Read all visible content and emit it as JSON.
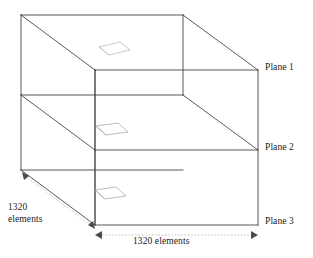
{
  "diagram": {
    "type": "3d-box-mesh-schematic",
    "title": "",
    "box": {
      "description": "Rectangular prism divided into three horizontal planes",
      "line_color": "#3a3a3a",
      "element_marker_color": "#b9b9b9",
      "dimension_line_color": "#9a9a9a"
    },
    "plane_labels": [
      {
        "id": "plane-1",
        "text": "Plane 1"
      },
      {
        "id": "plane-2",
        "text": "Plane 2"
      },
      {
        "id": "plane-3",
        "text": "Plane 3"
      }
    ],
    "dimensions": [
      {
        "id": "depth-dimension",
        "line1": "1320",
        "line2": "elements",
        "full_text": "1320 elements",
        "orientation": "depth-receding"
      },
      {
        "id": "width-dimension",
        "full_text": "1320 elements",
        "orientation": "horizontal-front-bottom"
      }
    ],
    "element_markers": [
      {
        "id": "element-marker-plane-1"
      },
      {
        "id": "element-marker-plane-2"
      },
      {
        "id": "element-marker-plane-3"
      }
    ]
  }
}
